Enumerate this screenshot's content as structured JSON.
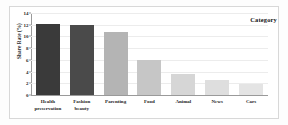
{
  "chart_data": {
    "type": "bar",
    "title": "",
    "subtitle": "",
    "xlabel": "",
    "ylabel": "Share Rate (%)",
    "ylim": [
      0,
      14
    ],
    "yticks": [
      0,
      2,
      4,
      6,
      8,
      10,
      12,
      14
    ],
    "ytick_labels": [
      "0",
      "2",
      "4",
      "6",
      "8",
      "10",
      "12",
      "14"
    ],
    "grid": "horizontal",
    "legend_position": "top-right",
    "annotation": "Category",
    "categories": [
      "Health preservation",
      "Fashion beauty",
      "Parenting",
      "Food",
      "Animal",
      "News",
      "Cars"
    ],
    "category_lines": [
      [
        "Health",
        "preservation"
      ],
      [
        "Fashion",
        "beauty"
      ],
      [
        "Parenting"
      ],
      [
        "Food"
      ],
      [
        "Animal"
      ],
      [
        "News"
      ],
      [
        "Cars"
      ]
    ],
    "values": [
      12.1,
      11.9,
      10.8,
      6.0,
      3.6,
      2.6,
      1.8
    ],
    "bar_colors": [
      "#3a3a3a",
      "#4a4a4a",
      "#b4b4b4",
      "#c6c6c6",
      "#d6d6d6",
      "#dedede",
      "#e4e4e4"
    ],
    "accent_color": "#3a3a3a",
    "background_color": "#ffffff",
    "grid_color": "#ececec",
    "axis_color": "#9a9a9a"
  }
}
